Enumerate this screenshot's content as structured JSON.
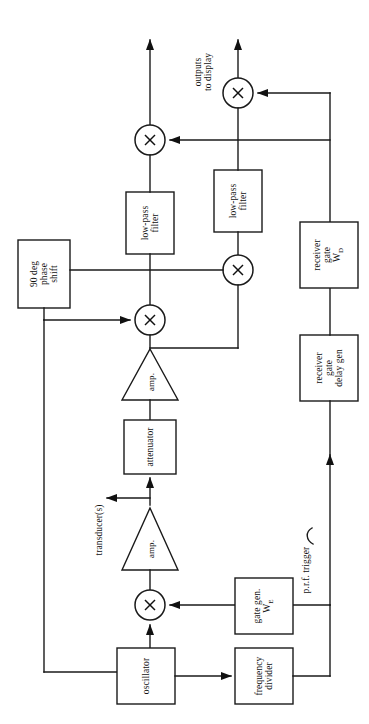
{
  "figure": {
    "orientation": "rotated-90-ccw",
    "ink_color": "#1a1a1a",
    "background_color": "#ffffff",
    "width": 369,
    "height": 724
  },
  "labels": {
    "outputs_to_display": "outputs\nto display",
    "outputs_to_display_line1": "outputs",
    "outputs_to_display_line2": "to display",
    "transducers": "transducer(s)",
    "prf_trigger": "p.r.f. trigger"
  },
  "blocks": [
    {
      "id": "mixer-out-1",
      "type": "mixer",
      "label": "X",
      "name": "mixer-output-upper"
    },
    {
      "id": "mixer-out-2",
      "type": "mixer",
      "label": "X",
      "name": "mixer-output-lower"
    },
    {
      "id": "lpf-1",
      "type": "box",
      "label": "low-pass\nfilter",
      "line1": "low-pass",
      "line2": "filter",
      "name": "low-pass-filter-upper"
    },
    {
      "id": "lpf-2",
      "type": "box",
      "label": "low-pass\nfilter",
      "line1": "low-pass",
      "line2": "filter",
      "name": "low-pass-filter-lower"
    },
    {
      "id": "phase-shift",
      "type": "box",
      "label": "90 deg\nphase\nshift",
      "line1": "90 deg",
      "line2": "phase",
      "line3": "shift",
      "name": "ninety-degree-phase-shift"
    },
    {
      "id": "mixer-quad",
      "type": "mixer",
      "label": "X",
      "name": "mixer-quadrature"
    },
    {
      "id": "mixer-detect",
      "type": "mixer",
      "label": "X",
      "name": "mixer-detector"
    },
    {
      "id": "amp-rx",
      "type": "triangle",
      "label": "amp.",
      "name": "amplifier-receive"
    },
    {
      "id": "attenuator",
      "type": "box",
      "label": "attenuator",
      "name": "attenuator"
    },
    {
      "id": "amp-tx",
      "type": "triangle",
      "label": "amp.",
      "name": "amplifier-transmit"
    },
    {
      "id": "mixer-tx",
      "type": "mixer",
      "label": "X",
      "name": "mixer-transmit-gate"
    },
    {
      "id": "oscillator",
      "type": "box",
      "label": "oscillator",
      "name": "oscillator"
    },
    {
      "id": "freq-divider",
      "type": "box",
      "label": "frequency\ndivider",
      "line1": "frequency",
      "line2": "divider",
      "name": "frequency-divider"
    },
    {
      "id": "gate-gen",
      "type": "box",
      "label": "gate gen. W_E",
      "line1": "gate gen.",
      "line2": "W",
      "subscript": "E",
      "name": "gate-generator-we"
    },
    {
      "id": "rx-gate",
      "type": "box",
      "label": "receiver gate W_D",
      "line1": "receiver",
      "line2": "gate",
      "line3": "W",
      "subscript": "D",
      "name": "receiver-gate-wd"
    },
    {
      "id": "rx-gate-delay",
      "type": "box",
      "label": "receiver gate delay gen",
      "line1": "receiver",
      "line2": "gate",
      "line3": "delay gen",
      "name": "receiver-gate-delay-generator"
    }
  ]
}
